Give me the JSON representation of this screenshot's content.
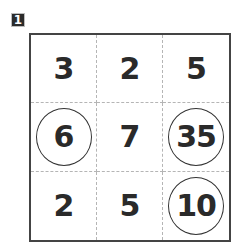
{
  "problem_label": "1",
  "grid": {
    "rows": [
      [
        {
          "value": "3",
          "circled": false
        },
        {
          "value": "2",
          "circled": false
        },
        {
          "value": "5",
          "circled": false
        }
      ],
      [
        {
          "value": "6",
          "circled": true
        },
        {
          "value": "7",
          "circled": false
        },
        {
          "value": "35",
          "circled": true
        }
      ],
      [
        {
          "value": "2",
          "circled": false
        },
        {
          "value": "5",
          "circled": false
        },
        {
          "value": "10",
          "circled": true
        }
      ]
    ]
  }
}
